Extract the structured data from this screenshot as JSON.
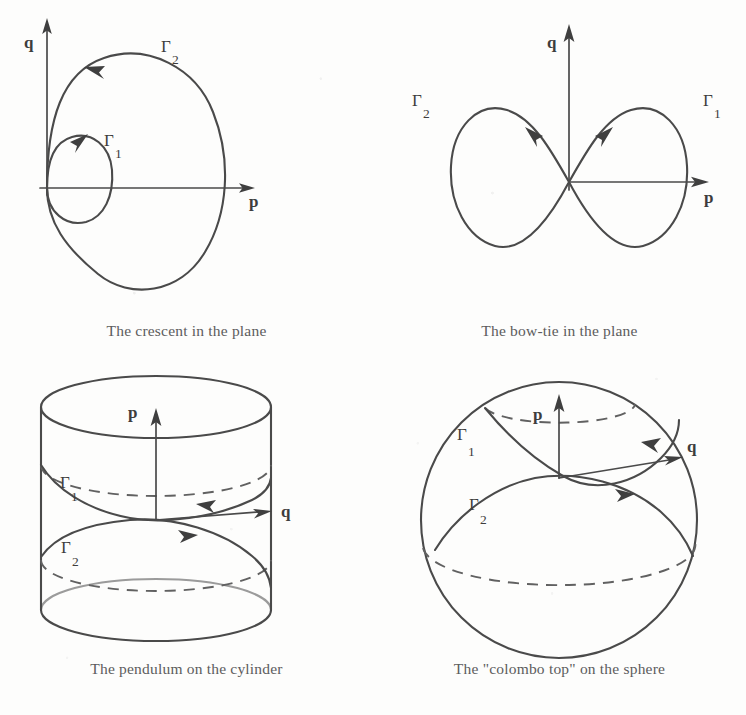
{
  "figure": {
    "kind": "four-panel phase-portrait plate",
    "ink_color": "#4a4a4a",
    "background_color": "#fdfdfc"
  },
  "panels": [
    {
      "id": "crescent",
      "caption": "The crescent in the plane",
      "axes": {
        "vertical_label": "q",
        "horizontal_label": "p"
      },
      "orbits": [
        {
          "label": "Γ",
          "subscript": "1",
          "name": "small-loop",
          "direction": "counterclockwise"
        },
        {
          "label": "Γ",
          "subscript": "2",
          "name": "large-loop",
          "direction": "counterclockwise"
        }
      ]
    },
    {
      "id": "bowtie",
      "caption": "The bow-tie in the plane",
      "axes": {
        "vertical_label": "q",
        "horizontal_label": "p"
      },
      "orbits": [
        {
          "label": "Γ",
          "subscript": "1",
          "name": "right-lobe",
          "direction": "inward-at-origin"
        },
        {
          "label": "Γ",
          "subscript": "2",
          "name": "left-lobe",
          "direction": "inward-at-origin"
        }
      ]
    },
    {
      "id": "cylinder",
      "caption": "The pendulum on the cylinder",
      "axes": {
        "vertical_label": "p",
        "horizontal_label": "q"
      },
      "orbits": [
        {
          "label": "Γ",
          "subscript": "1",
          "name": "upper-helix",
          "direction": "leftward-arrow"
        },
        {
          "label": "Γ",
          "subscript": "2",
          "name": "lower-helix",
          "direction": "rightward-arrow"
        }
      ]
    },
    {
      "id": "sphere",
      "caption": "The \"colombo top\" on the sphere",
      "axes": {
        "vertical_label": "p",
        "horizontal_label": "q"
      },
      "orbits": [
        {
          "label": "Γ",
          "subscript": "1",
          "name": "upper-loop",
          "direction": "rightward-arrow"
        },
        {
          "label": "Γ",
          "subscript": "2",
          "name": "lower-loop",
          "direction": "rightward-arrow"
        }
      ]
    }
  ]
}
